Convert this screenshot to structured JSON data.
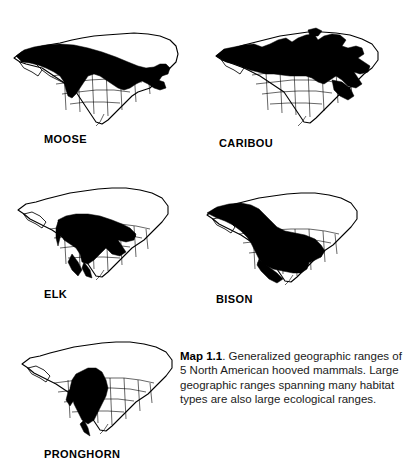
{
  "figure": {
    "label": "Map 1.1",
    "type": "range-map-series",
    "region": "North America",
    "background_color": "#ffffff",
    "range_fill_color": "#000000",
    "outline_color": "#000000"
  },
  "maps": [
    {
      "id": "moose",
      "label": "MOOSE",
      "species": "Moose",
      "range_description": "Boreal forest belt from Alaska and the Yukon east across central and eastern Canada into the northern Great Lakes states and New England"
    },
    {
      "id": "caribou",
      "label": "CARIBOU",
      "species": "Caribou",
      "range_description": "Nearly all of Alaska and Canada including the arctic tundra and boreal zones, reaching the Canadian Maritimes and northern Great Lakes"
    },
    {
      "id": "elk",
      "label": "ELK",
      "species": "Elk",
      "range_description": "Most of the central and western United States extending into southern Canada and northern Mexico"
    },
    {
      "id": "bison",
      "label": "BISON",
      "species": "Bison",
      "range_description": "Broad northwest to southeast swath from interior Alaska and western Canada across the Great Plains to the southeastern United States"
    },
    {
      "id": "pronghorn",
      "label": "PRONGHORN",
      "species": "Pronghorn",
      "range_description": "Western interior grasslands and deserts from southern Canada through the Great Basin and Great Plains into north-central Mexico"
    }
  ],
  "caption": {
    "bold_prefix": "Map 1.1",
    "text": ". Generalized geographic ranges of 5 North American hooved mammals. Large geographic ranges spanning many habitat types are also large ecological ranges."
  }
}
